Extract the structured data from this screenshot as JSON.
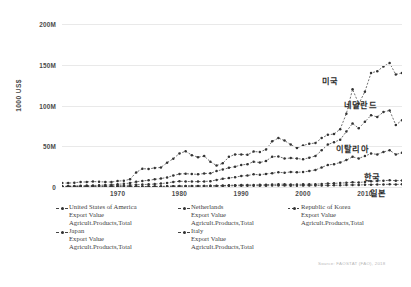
{
  "chart_data": {
    "type": "line",
    "title": "",
    "subtitle": "",
    "xlabel": "",
    "ylabel": "1000 US$",
    "xlim": [
      1961,
      2016
    ],
    "ylim": [
      0,
      200000000
    ],
    "grid": true,
    "legend_position": "bottom",
    "ytick_labels": [
      "200M",
      "150M",
      "100M",
      "50M",
      "0"
    ],
    "ytick_values": [
      200000000,
      150000000,
      100000000,
      50000000,
      0
    ],
    "xtick_labels": [
      "1970",
      "1980",
      "1990",
      "2000",
      "2010"
    ],
    "xtick_values": [
      1970,
      1980,
      1990,
      2000,
      2010
    ],
    "x": [
      1961,
      1962,
      1963,
      1964,
      1965,
      1966,
      1967,
      1968,
      1969,
      1970,
      1971,
      1972,
      1973,
      1974,
      1975,
      1976,
      1977,
      1978,
      1979,
      1980,
      1981,
      1982,
      1983,
      1984,
      1985,
      1986,
      1987,
      1988,
      1989,
      1990,
      1991,
      1992,
      1993,
      1994,
      1995,
      1996,
      1997,
      1998,
      1999,
      2000,
      2001,
      2002,
      2003,
      2004,
      2005,
      2006,
      2007,
      2008,
      2009,
      2010,
      2011,
      2012,
      2013,
      2014,
      2015,
      2016
    ],
    "series": [
      {
        "name": "United States of America",
        "label_ko": "미국",
        "sublabel": "Export Value",
        "category": "Agricult.Products,Total",
        "color": "#333333",
        "values": [
          4900,
          4800,
          5200,
          6100,
          6200,
          6700,
          6400,
          6200,
          6100,
          7300,
          7700,
          9500,
          17900,
          22400,
          22200,
          23400,
          24000,
          29900,
          34700,
          41200,
          43800,
          39100,
          36600,
          38000,
          31000,
          26300,
          29000,
          37000,
          40000,
          40000,
          39500,
          43500,
          43000,
          46000,
          56000,
          60000,
          57000,
          52000,
          48000,
          51000,
          53000,
          54000,
          60000,
          64000,
          65000,
          71000,
          90000,
          120000,
          102000,
          117000,
          140000,
          142000,
          148000,
          152000,
          138000,
          140000
        ],
        "values_note": "thousand US$ x1000 (axis shows 1000 US$ with M suffix)"
      },
      {
        "name": "Netherlands",
        "label_ko": "네덜란드",
        "sublabel": "Export Value",
        "category": "Agricult.Products,Total",
        "color": "#333333",
        "values": [
          1000,
          1100,
          1300,
          1500,
          1700,
          1900,
          2100,
          2400,
          2800,
          3300,
          3900,
          4900,
          6400,
          7500,
          8200,
          9400,
          10300,
          11800,
          14000,
          16000,
          16400,
          15800,
          15600,
          16500,
          16800,
          19500,
          21500,
          23500,
          25000,
          27000,
          28000,
          31000,
          30000,
          32000,
          37000,
          37500,
          35000,
          35500,
          35000,
          34000,
          36000,
          38000,
          45000,
          52000,
          55000,
          58000,
          68000,
          78000,
          72000,
          80000,
          88000,
          86000,
          92000,
          94000,
          76000,
          82000
        ]
      },
      {
        "name": "Italy",
        "label_ko": "이탈리아",
        "sublabel": "Export Value",
        "category": "Agricult.Products,Total",
        "color": "#333333",
        "values": [
          600,
          650,
          700,
          800,
          900,
          1000,
          1100,
          1200,
          1400,
          1600,
          1800,
          2200,
          2800,
          3000,
          3300,
          3600,
          4200,
          5000,
          6200,
          7000,
          6800,
          6600,
          6600,
          6800,
          7200,
          8600,
          10000,
          11000,
          12000,
          13500,
          14000,
          15500,
          15000,
          16000,
          17000,
          18000,
          17500,
          18500,
          18000,
          18500,
          19500,
          21000,
          24000,
          27000,
          28000,
          30000,
          33000,
          37000,
          35000,
          38000,
          41000,
          40000,
          43000,
          45000,
          40000,
          42000
        ]
      },
      {
        "name": "Republic of Korea",
        "label_ko": "한국",
        "sublabel": "Export Value",
        "category": "Agricult.Products,Total",
        "color": "#333333",
        "values": [
          30,
          40,
          50,
          60,
          80,
          100,
          120,
          150,
          180,
          200,
          230,
          280,
          400,
          450,
          500,
          600,
          700,
          850,
          1000,
          1100,
          1200,
          1250,
          1300,
          1350,
          1400,
          1600,
          1800,
          2100,
          2300,
          2400,
          2500,
          2600,
          2700,
          2900,
          3200,
          3400,
          3400,
          3000,
          3200,
          3300,
          3300,
          3500,
          3800,
          4200,
          4500,
          4800,
          5200,
          5800,
          5600,
          6200,
          7000,
          7500,
          7800,
          8200,
          7800,
          8000
        ]
      },
      {
        "name": "Japan",
        "label_ko": "일본",
        "sublabel": "Export Value",
        "category": "Agricult.Products,Total",
        "color": "#333333",
        "values": [
          200,
          220,
          240,
          260,
          280,
          300,
          320,
          350,
          380,
          400,
          430,
          480,
          560,
          620,
          650,
          700,
          760,
          850,
          950,
          1000,
          1050,
          1050,
          1050,
          1100,
          1100,
          1200,
          1300,
          1400,
          1500,
          1550,
          1600,
          1650,
          1600,
          1650,
          1700,
          1750,
          1700,
          1600,
          1650,
          1700,
          1700,
          1750,
          1850,
          1950,
          2050,
          2150,
          2350,
          2600,
          2500,
          2700,
          2900,
          3000,
          3100,
          3300,
          3200,
          3300
        ]
      }
    ]
  },
  "axis": {
    "ylabel": "1000 US$"
  },
  "annotations": [
    {
      "id": "usa",
      "text": "미국"
    },
    {
      "id": "netherlands",
      "text": "네덜란드"
    },
    {
      "id": "italy",
      "text": "이탈리아"
    },
    {
      "id": "korea",
      "text": "한국"
    },
    {
      "id": "japan",
      "text": "일본"
    }
  ],
  "legend": {
    "items": [
      {
        "name": "United States of America",
        "line2": "Export Value",
        "line3": "Agricult.Products,Total"
      },
      {
        "name": "Netherlands",
        "line2": "Export Value",
        "line3": "Agricult.Products,Total"
      },
      {
        "name": "Republic of Korea",
        "line2": "Export Value",
        "line3": "Agricult.Products,Total"
      },
      {
        "name": "Japan",
        "line2": "Export Value",
        "line3": "Agricult.Products,Total"
      },
      {
        "name": "Italy",
        "line2": "Export Value",
        "line3": "Agricult.Products,Total"
      }
    ]
  },
  "source": {
    "text": "Source: FAOSTAT (FAO), 2018"
  }
}
